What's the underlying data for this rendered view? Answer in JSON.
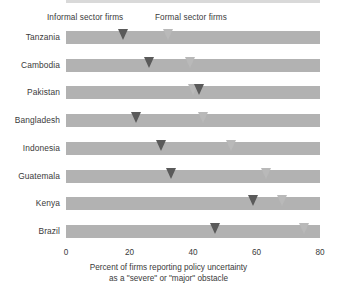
{
  "legend": {
    "informal": "Informal sector firms",
    "formal": "Formal sector firms"
  },
  "axis": {
    "ticks": [
      "0",
      "20",
      "40",
      "60",
      "80"
    ]
  },
  "caption": {
    "line1": "Percent of firms reporting policy uncertainty",
    "line2": "as a \"severe\" or \"major\" obstacle"
  },
  "colors": {
    "informal_marker": "#5a5a5a",
    "formal_marker": "#b9b9b9",
    "band": "#b2b2b2",
    "background": "#ffffff",
    "text": "#3a3a3a"
  },
  "chart_data": {
    "type": "scatter",
    "title": "",
    "subtitle": "",
    "xlabel": "Percent of firms reporting policy uncertainty as a \"severe\" or \"major\" obstacle",
    "ylabel": "",
    "xlim": [
      0,
      80
    ],
    "xticks": [
      0,
      20,
      40,
      60,
      80
    ],
    "grid": false,
    "legend_position": "top",
    "orientation": "horizontal",
    "categories": [
      "Tanzania",
      "Cambodia",
      "Pakistan",
      "Bangladesh",
      "Indonesia",
      "Guatemala",
      "Kenya",
      "Brazil"
    ],
    "series": [
      {
        "name": "Informal sector firms",
        "color": "#5a5a5a",
        "values": [
          18,
          26,
          42,
          22,
          30,
          33,
          59,
          47
        ]
      },
      {
        "name": "Formal sector firms",
        "color": "#b9b9b9",
        "values": [
          32,
          39,
          40,
          43,
          52,
          63,
          68,
          75
        ]
      }
    ]
  }
}
